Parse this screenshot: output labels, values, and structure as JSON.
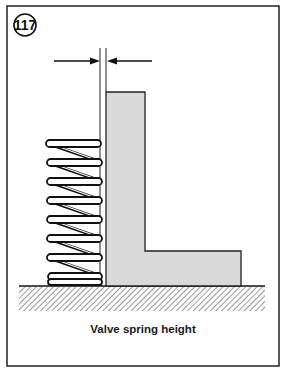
{
  "figure": {
    "number": "117",
    "caption": "Valve spring height"
  },
  "diagram": {
    "frame": {
      "x": 7,
      "y": 6,
      "w": 272,
      "h": 360,
      "stroke": "#222222"
    },
    "badge": {
      "cx": 25,
      "cy": 25,
      "r": 11
    },
    "dimension_arrows": {
      "y": 61,
      "left_arrow": {
        "x1": 54,
        "x2": 100
      },
      "right_arrow": {
        "x1": 152,
        "x2": 107
      },
      "extension_lines_x": [
        100,
        106
      ],
      "extension_lines_y": [
        48,
        286
      ]
    },
    "block": {
      "fill": "#d9d9d9",
      "stroke": "#222222",
      "points": [
        [
          106,
          92
        ],
        [
          145,
          92
        ],
        [
          145,
          251
        ],
        [
          241,
          251
        ],
        [
          241,
          286
        ],
        [
          106,
          286
        ]
      ]
    },
    "spring": {
      "x_left": 45,
      "x_right": 102,
      "y_top": 140,
      "y_bottom": 286,
      "coils": 8
    },
    "ground": {
      "line_y": 286,
      "x1": 19,
      "x2": 265,
      "hatch_bottom": 311
    },
    "colors": {
      "ink": "#1a1a1a",
      "block_fill": "#d9d9d9",
      "background": "#ffffff"
    }
  }
}
